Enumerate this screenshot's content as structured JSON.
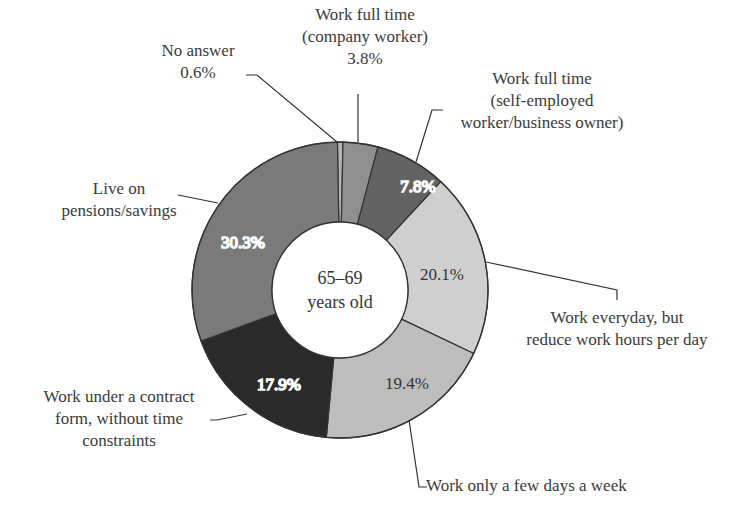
{
  "chart_data": {
    "type": "pie",
    "subtype": "donut",
    "title": "",
    "center_label": [
      "65–69",
      "years old"
    ],
    "categories": [
      "No answer",
      "Work full time (company worker)",
      "Work full time (self-employed worker/business owner)",
      "Work everyday, but reduce work hours per day",
      "Work only a few days a week",
      "Work under a contract form, without time constraints",
      "Live on pensions/savings"
    ],
    "values": [
      0.6,
      3.8,
      7.8,
      20.1,
      19.4,
      17.9,
      30.3
    ],
    "value_labels": [
      "0.6%",
      "3.8%",
      "7.8%",
      "20.1%",
      "19.4%",
      "17.9%",
      "30.3%"
    ],
    "colors": [
      "#b4b4b4",
      "#8f8f8f",
      "#636363",
      "#cfcfcf",
      "#bdbdbd",
      "#2a2a2a",
      "#7a7a7a"
    ],
    "start_angle_deg": -1,
    "direction": "clockwise",
    "legend": "none (callout labels)"
  },
  "labels": {
    "no_answer": [
      "No answer",
      "0.6%"
    ],
    "company_worker": [
      "Work full time",
      "(company worker)",
      "3.8%"
    ],
    "self_employed": [
      "Work full time",
      "(self-employed",
      "worker/business owner)"
    ],
    "reduce_hours": [
      "Work everyday, but",
      "reduce work hours per day"
    ],
    "few_days": [
      "Work only a few days a week"
    ],
    "contract": [
      "Work under a contract",
      "form, without time",
      "constraints"
    ],
    "pensions": [
      "Live on",
      "pensions/savings"
    ]
  },
  "inner_labels": {
    "self_employed": "7.8%",
    "reduce_hours": "20.1%",
    "few_days": "19.4%",
    "contract": "17.9%",
    "pensions": "30.3%"
  }
}
